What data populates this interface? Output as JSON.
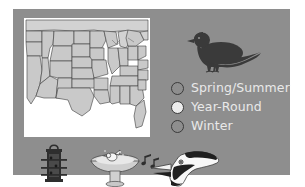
{
  "poster": {
    "background_color": "#8e8e8e",
    "page_background_color": "#ffffff"
  },
  "map": {
    "name": "united-states-range-map",
    "land_fill": "#c9c9c9",
    "border_color": "#3c3c3c",
    "background": "#ffffff"
  },
  "bird_illustration": {
    "name": "pigeon-silhouette",
    "color": "#3a3a3a"
  },
  "legend": {
    "items": [
      {
        "label": "Spring/Summer",
        "swatch_color": "#8e8e8e",
        "outline_color": "#3a3a3a"
      },
      {
        "label": "Year-Round",
        "swatch_color": "#ececec",
        "outline_color": "#3a3a3a"
      },
      {
        "label": "Winter",
        "swatch_color": "#8e8e8e",
        "outline_color": "#3a3a3a"
      }
    ],
    "text_color": "#e9e9e9"
  },
  "bottom_icons": [
    {
      "name": "bird-feeder-icon",
      "color": "#2e2e2e"
    },
    {
      "name": "birdbath-icon",
      "color": "#d8d8d8"
    },
    {
      "name": "singing-bird-head-icon",
      "color": "#f2f2f2"
    },
    {
      "name": "music-notes-icon",
      "color": "#2e2e2e"
    }
  ]
}
